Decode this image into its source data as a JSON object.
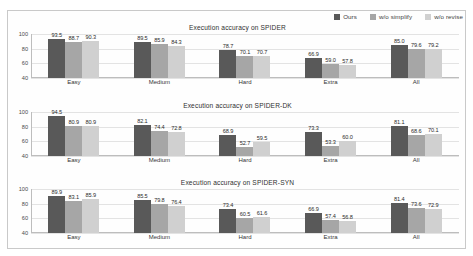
{
  "legend": {
    "position": "top-right",
    "items": [
      {
        "label": "Ours",
        "color": "#595959"
      },
      {
        "label": "w/o simplify",
        "color": "#a6a6a6"
      },
      {
        "label": "w/o revise",
        "color": "#d0d0d0"
      }
    ]
  },
  "axis": {
    "yticks": [
      "100",
      "80",
      "60",
      "40"
    ],
    "ylim": [
      40,
      100
    ]
  },
  "chart_data": [
    {
      "type": "bar",
      "title": "Execution accuracy on SPIDER",
      "xlabel": "",
      "ylabel": "",
      "ylim": [
        40,
        100
      ],
      "grid": true,
      "legend_position": "top-right",
      "categories": [
        "Easy",
        "Medium",
        "Hard",
        "Extra",
        "All"
      ],
      "series": [
        {
          "name": "Ours",
          "values": [
            93.5,
            89.5,
            78.7,
            66.9,
            85.0
          ]
        },
        {
          "name": "w/o simplify",
          "values": [
            88.7,
            85.9,
            70.1,
            59.0,
            79.6
          ]
        },
        {
          "name": "w/o revise",
          "values": [
            90.3,
            84.3,
            70.7,
            57.8,
            79.2
          ]
        }
      ]
    },
    {
      "type": "bar",
      "title": "Execution accuracy on SPIDER-DK",
      "xlabel": "",
      "ylabel": "",
      "ylim": [
        40,
        100
      ],
      "grid": true,
      "legend_position": "top-right",
      "categories": [
        "Easy",
        "Medium",
        "Hard",
        "Extra",
        "All"
      ],
      "series": [
        {
          "name": "Ours",
          "values": [
            94.5,
            82.1,
            68.9,
            73.3,
            81.1
          ]
        },
        {
          "name": "w/o simplify",
          "values": [
            80.9,
            74.4,
            52.7,
            53.3,
            68.6
          ]
        },
        {
          "name": "w/o revise",
          "values": [
            80.9,
            72.8,
            59.5,
            60.0,
            70.1
          ]
        }
      ]
    },
    {
      "type": "bar",
      "title": "Execution accuracy on SPIDER-SYN",
      "xlabel": "",
      "ylabel": "",
      "ylim": [
        40,
        100
      ],
      "grid": true,
      "legend_position": "top-right",
      "categories": [
        "Easy",
        "Medium",
        "Hard",
        "Extra",
        "All"
      ],
      "series": [
        {
          "name": "Ours",
          "values": [
            89.9,
            85.5,
            73.4,
            66.9,
            81.4
          ]
        },
        {
          "name": "w/o simplify",
          "values": [
            83.1,
            79.8,
            60.5,
            57.4,
            73.6
          ]
        },
        {
          "name": "w/o revise",
          "values": [
            85.9,
            76.4,
            61.6,
            56.8,
            72.9
          ]
        }
      ]
    }
  ]
}
